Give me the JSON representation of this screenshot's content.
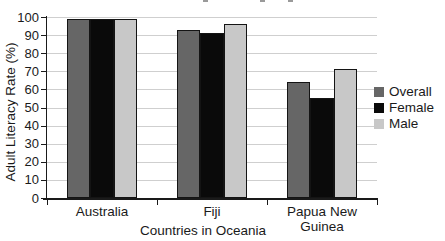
{
  "chart_data": {
    "type": "bar",
    "categories": [
      "Australia",
      "Fiji",
      "Papua New Guinea"
    ],
    "series": [
      {
        "name": "Overall",
        "color": "#666666",
        "values": [
          99,
          93,
          64
        ]
      },
      {
        "name": "Female",
        "color": "#0a0a0a",
        "values": [
          99,
          91,
          55
        ]
      },
      {
        "name": "Male",
        "color": "#c8c8c8",
        "values": [
          99,
          96,
          71
        ]
      }
    ],
    "xlabel": "Countries in Oceania",
    "ylabel": "Adult Literacy Rate (%)",
    "ylim": [
      0,
      100
    ],
    "yticks": [
      0,
      10,
      20,
      30,
      40,
      50,
      60,
      70,
      80,
      90,
      100
    ],
    "grid": true,
    "legend_position": "right",
    "gridline_color": "#cfcfcf",
    "axis_color": "#1a1a1a",
    "bar_border_color": "#141414",
    "text_color": "#1a1a1a",
    "background": "#ffffff"
  }
}
